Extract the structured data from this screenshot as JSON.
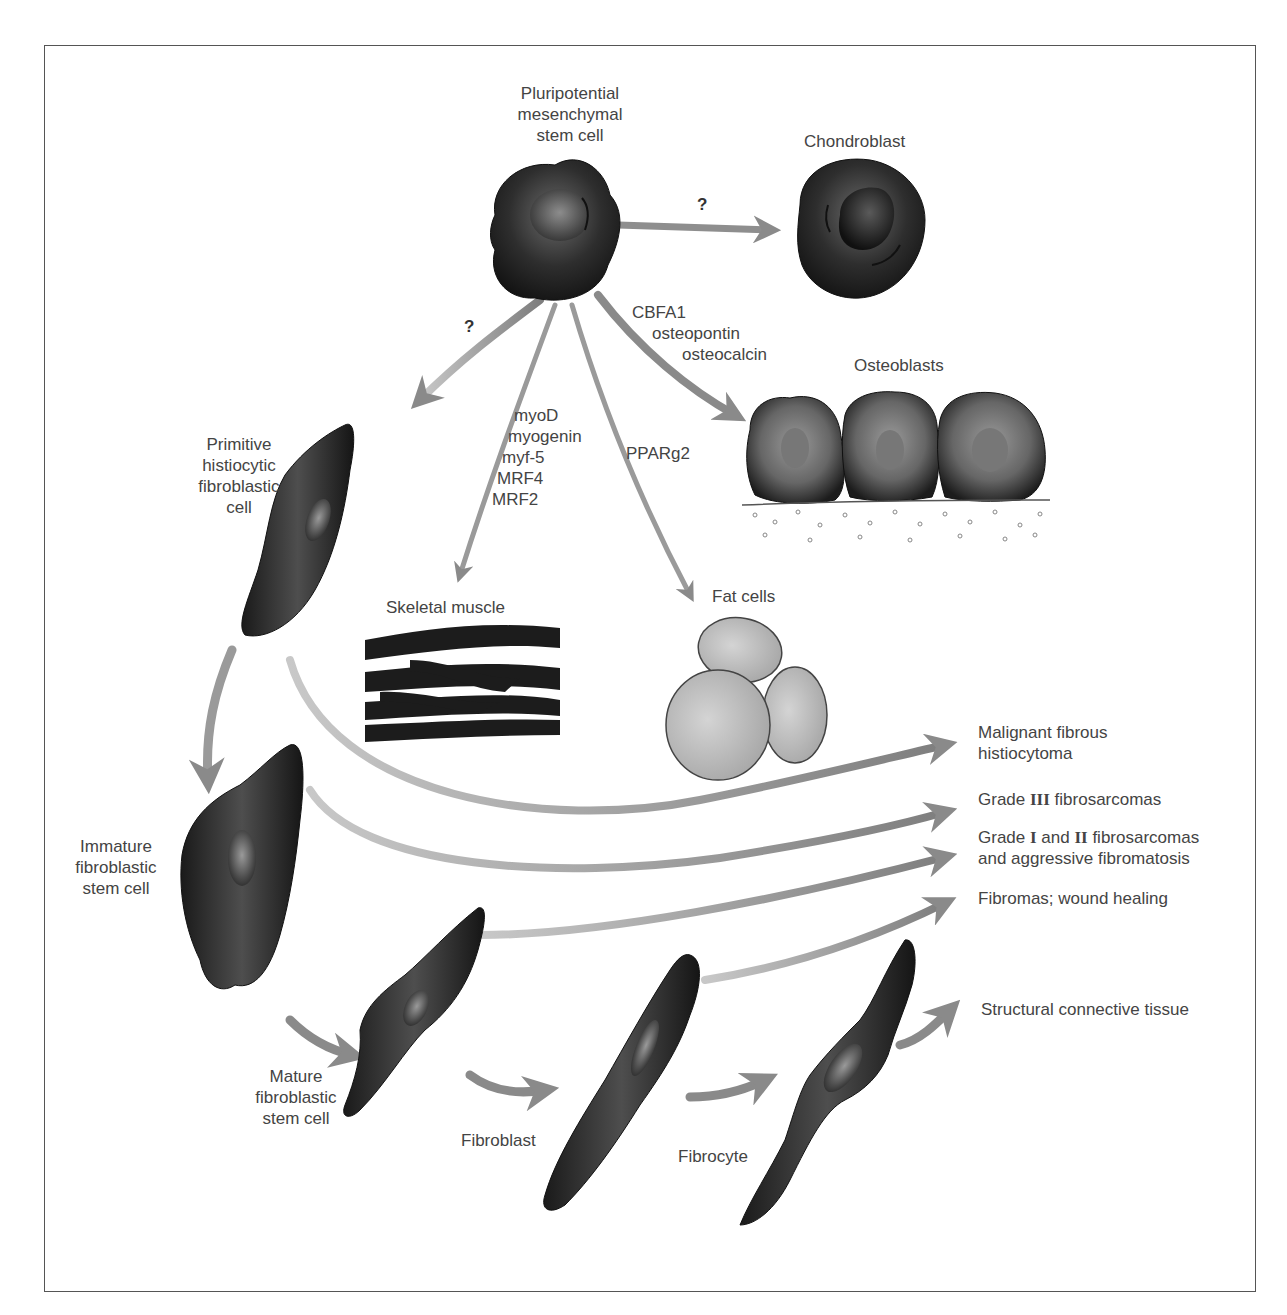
{
  "diagram": {
    "type": "cell-lineage-flow",
    "frame": {
      "border_color": "#555555"
    },
    "colors": {
      "arrow": "#8a8a8a",
      "cell_dark": "#1e1e1e",
      "fat_cell": "#b5b5b5",
      "text": "#444444"
    },
    "nodes": {
      "stem_cell": {
        "label_lines": [
          "Pluripotential",
          "mesenchymal",
          "stem cell"
        ]
      },
      "chondroblast": {
        "label": "Chondroblast"
      },
      "osteoblasts": {
        "label": "Osteoblasts"
      },
      "primitive": {
        "label_lines": [
          "Primitive",
          "histiocytic",
          "fibroblastic",
          "cell"
        ]
      },
      "skeletal_muscle": {
        "label": "Skeletal muscle"
      },
      "fat_cells": {
        "label": "Fat cells"
      },
      "immature": {
        "label_lines": [
          "Immature",
          "fibroblastic",
          "stem cell"
        ]
      },
      "mature": {
        "label_lines": [
          "Mature",
          "fibroblastic",
          "stem cell"
        ]
      },
      "fibroblast": {
        "label": "Fibroblast"
      },
      "fibrocyte": {
        "label": "Fibrocyte"
      }
    },
    "edge_labels": {
      "to_chondroblast": "?",
      "to_primitive": "?",
      "osteo_factors": [
        "CBFA1",
        "osteopontin",
        "osteocalcin"
      ],
      "muscle_factors": [
        "myoD",
        "myogenin",
        "myf-5",
        "MRF4",
        "MRF2"
      ],
      "fat_factors": [
        "PPARg2"
      ]
    },
    "outcomes": {
      "mfh": {
        "lines": [
          "Malignant fibrous",
          "histiocytoma"
        ]
      },
      "grade3": {
        "pre": "Grade ",
        "roman": "III",
        "post": " fibrosarcomas"
      },
      "grade12": {
        "pre": "Grade ",
        "roman1": "I",
        "mid": " and ",
        "roman2": "II",
        "post": " fibrosarcomas",
        "line2": "and aggressive fibromatosis"
      },
      "fibromas": {
        "label": "Fibromas; wound healing"
      },
      "structural": {
        "label": "Structural connective tissue"
      }
    }
  }
}
